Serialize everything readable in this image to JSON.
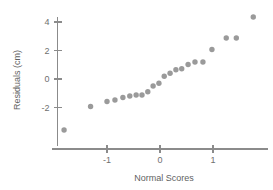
{
  "chart_data": {
    "type": "scatter",
    "title": "",
    "subtitle": "",
    "xlabel": "Normal Scores",
    "ylabel": "Residuals (cm)",
    "xlim": [
      -2.1,
      2.05
    ],
    "ylim": [
      -4.2,
      5.0
    ],
    "xticks": [
      -1,
      0,
      1
    ],
    "xtick_labels": [
      "-1",
      "0",
      "1"
    ],
    "yticks": [
      -2,
      0,
      2,
      4
    ],
    "ytick_labels": [
      "-2",
      "0",
      "2",
      "4"
    ],
    "grid": false,
    "legend": null,
    "legend_position": "none",
    "point_color": "#9a9a9a",
    "axis_color": "#8b8b8b",
    "background": "#ffffff",
    "n_points": 22,
    "x": [
      -1.81,
      -1.31,
      -1.0,
      -0.85,
      -0.7,
      -0.57,
      -0.45,
      -0.34,
      -0.23,
      -0.13,
      -0.02,
      0.08,
      0.19,
      0.3,
      0.41,
      0.53,
      0.66,
      0.81,
      0.98,
      1.25,
      1.44,
      1.76
    ],
    "y": [
      -3.58,
      -1.93,
      -1.58,
      -1.47,
      -1.3,
      -1.19,
      -1.12,
      -1.12,
      -0.89,
      -0.49,
      -0.3,
      0.19,
      0.4,
      0.65,
      0.72,
      1.02,
      1.19,
      1.19,
      2.07,
      2.88,
      2.88,
      4.35
    ],
    "points": [
      {
        "x": -1.81,
        "y": -3.58
      },
      {
        "x": -1.31,
        "y": -1.93
      },
      {
        "x": -1.0,
        "y": -1.58
      },
      {
        "x": -0.85,
        "y": -1.47
      },
      {
        "x": -0.7,
        "y": -1.3
      },
      {
        "x": -0.57,
        "y": -1.19
      },
      {
        "x": -0.45,
        "y": -1.12
      },
      {
        "x": -0.34,
        "y": -1.12
      },
      {
        "x": -0.23,
        "y": -0.89
      },
      {
        "x": -0.13,
        "y": -0.49
      },
      {
        "x": -0.02,
        "y": -0.3
      },
      {
        "x": 0.08,
        "y": 0.19
      },
      {
        "x": 0.19,
        "y": 0.4
      },
      {
        "x": 0.3,
        "y": 0.65
      },
      {
        "x": 0.41,
        "y": 0.72
      },
      {
        "x": 0.53,
        "y": 1.02
      },
      {
        "x": 0.66,
        "y": 1.19
      },
      {
        "x": 0.81,
        "y": 1.19
      },
      {
        "x": 0.98,
        "y": 2.07
      },
      {
        "x": 1.25,
        "y": 2.88
      },
      {
        "x": 1.44,
        "y": 2.88
      },
      {
        "x": 1.76,
        "y": 4.35
      }
    ]
  },
  "labels": {
    "x_axis_title": "Normal Scores",
    "y_axis_title": "Residuals (cm)"
  }
}
